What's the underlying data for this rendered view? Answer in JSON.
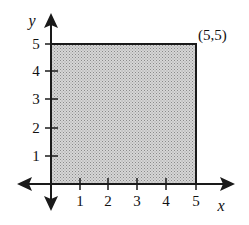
{
  "diagram": {
    "type": "coordinate-plane-region",
    "x_axis_label": "x",
    "y_axis_label": "y",
    "x_ticks": [
      "1",
      "2",
      "3",
      "4",
      "5"
    ],
    "y_ticks": [
      "1",
      "2",
      "3",
      "4",
      "5"
    ],
    "corner_label": "(5,5)",
    "region": {
      "x_min": 0,
      "x_max": 5,
      "y_min": 0,
      "y_max": 5,
      "fill": "#c8c8c8",
      "stroke": "#1a1a1a"
    },
    "colors": {
      "axis": "#1a1a1a",
      "background": "#ffffff"
    }
  }
}
